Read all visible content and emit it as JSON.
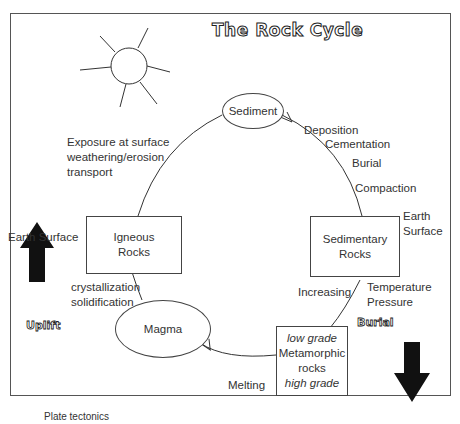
{
  "title": "The Rock Cycle",
  "nodes": {
    "sediment": "Sediment",
    "igneous": [
      "Igneous",
      "Rocks"
    ],
    "sedimentary": [
      "Sedimentary",
      "Rocks"
    ],
    "magma": "Magma",
    "metamorphic": {
      "top": "low grade",
      "middle": [
        "Metamorphic",
        "rocks"
      ],
      "bottom": "high grade"
    }
  },
  "labels": {
    "exposure": [
      "Exposure at surface",
      "weathering/erosion",
      "transport"
    ],
    "deposition": "Deposition",
    "cementation": "Cementation",
    "burial_step": "Burial",
    "compaction": "Compaction",
    "earth_surface_right": [
      "Earth",
      "Surface"
    ],
    "earth_surface_left": "Earth Surface",
    "crystallization": [
      "crystallization",
      "solidification"
    ],
    "increasing": "Increasing",
    "temp_pressure": [
      "Temperature",
      "Pressure"
    ],
    "melting": "Melting",
    "uplift": "Uplift",
    "burial": "Burial",
    "caption": "Plate tectonics"
  }
}
